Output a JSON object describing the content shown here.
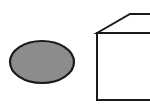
{
  "diagram": {
    "background": "#ffffff",
    "shapes": [
      {
        "type": "ellipse",
        "name": "gray-ellipse",
        "cx": 42,
        "cy": 62,
        "rx": 32,
        "ry": 21,
        "fill": "#8c8c8c",
        "stroke": "#1a1a1a"
      },
      {
        "type": "cube",
        "name": "cube",
        "fill": "#ffffff",
        "stroke": "#1a1a1a"
      }
    ]
  }
}
